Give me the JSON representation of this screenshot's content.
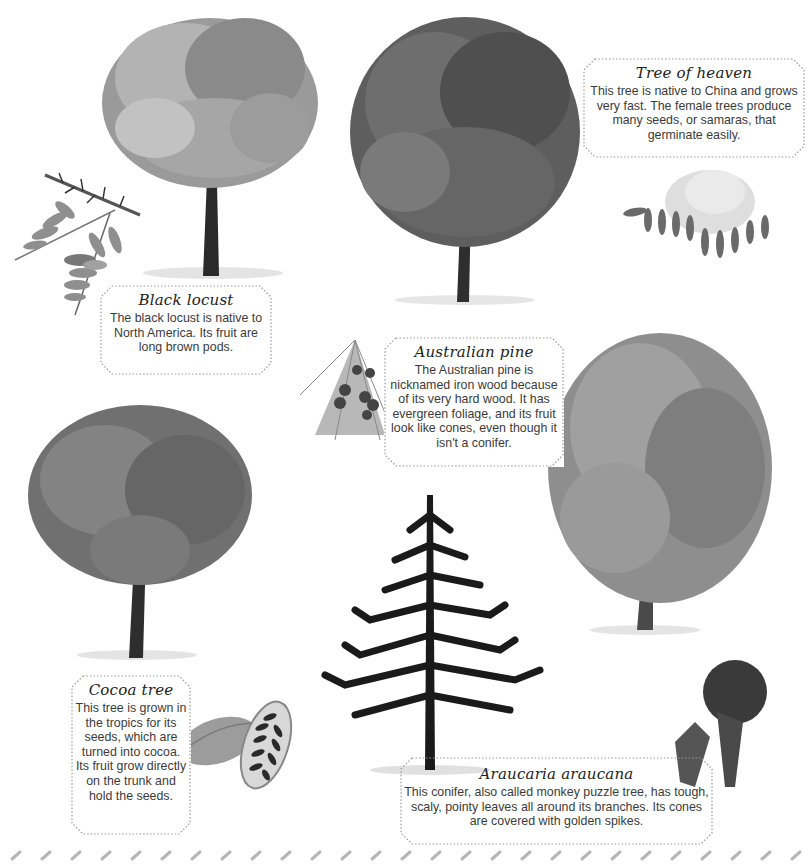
{
  "page": {
    "background": "#ffffff",
    "ink_color": "#3a3a3a",
    "border_color": "#9a9a9a"
  },
  "trees": [
    {
      "id": "black-locust",
      "title": "Black locust",
      "description": "The black locust is native to North America. Its fruit are long brown pods.",
      "illustrations": [
        "black-locust-tree",
        "black-locust-thorny-leaf-branch"
      ]
    },
    {
      "id": "tree-of-heaven",
      "title": "Tree of heaven",
      "description": "This tree is native to China and grows very fast. The female trees produce many seeds, or samaras, that germinate easily.",
      "illustrations": [
        "tree-of-heaven-tree",
        "tree-of-heaven-leaves-and-seed-cluster"
      ]
    },
    {
      "id": "australian-pine",
      "title": "Australian pine",
      "description": "The Australian pine is nicknamed iron wood because of its very hard wood. It has evergreen foliage, and its fruit look like cones, even though it isn't a conifer.",
      "illustrations": [
        "australian-pine-tree",
        "australian-pine-foliage-and-cones"
      ]
    },
    {
      "id": "cocoa-tree",
      "title": "Cocoa tree",
      "description": "This tree is grown in the tropics for its seeds, which are turned into cocoa. Its fruit grow directly on the trunk and hold the seeds.",
      "illustrations": [
        "cocoa-tree",
        "cocoa-pods"
      ]
    },
    {
      "id": "araucaria-araucana",
      "title": "Araucaria araucana",
      "description": "This conifer, also called monkey puzzle tree, has tough, scaly, pointy leaves all around its branches. Its cones are covered with golden spikes.",
      "illustrations": [
        "araucaria-tree",
        "araucaria-branch-with-cone"
      ]
    }
  ]
}
